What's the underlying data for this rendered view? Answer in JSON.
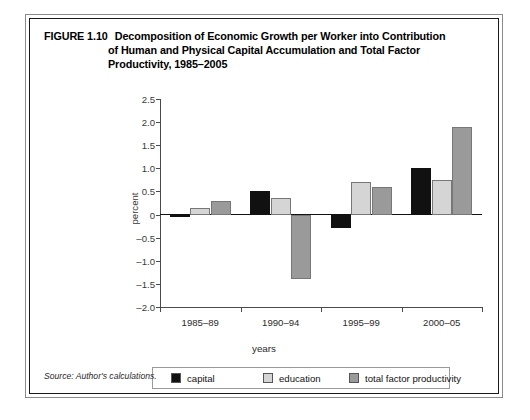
{
  "figure": {
    "number": "FIGURE 1.10",
    "title_lines": [
      "Decomposition of Economic Growth per Worker into Contribution",
      "of Human and Physical Capital Accumulation and Total Factor",
      "Productivity, 1985–2005"
    ],
    "source": "Source: Author's calculations."
  },
  "chart_data": {
    "type": "bar",
    "title": "Decomposition of Economic Growth per Worker into Contribution of Human and Physical Capital Accumulation and Total Factor Productivity, 1985–2005",
    "xlabel": "years",
    "ylabel": "percent",
    "categories": [
      "1985–89",
      "1990–94",
      "1995–99",
      "2000–05"
    ],
    "series": [
      {
        "name": "capital",
        "color": "#111111",
        "values": [
          -0.05,
          0.5,
          -0.3,
          1.0
        ]
      },
      {
        "name": "education",
        "color": "#d5d5d5",
        "values": [
          0.15,
          0.35,
          0.7,
          0.75
        ]
      },
      {
        "name": "total factor productivity",
        "color": "#9a9a9a",
        "values": [
          0.3,
          -1.4,
          0.6,
          1.9
        ]
      }
    ],
    "ylim": [
      -2.0,
      2.5
    ],
    "yticks": [
      2.5,
      2.0,
      1.5,
      1.0,
      0.5,
      0,
      -0.5,
      -1.0,
      -1.5,
      -2.0
    ],
    "ytick_labels": [
      "2.5",
      "2.0",
      "1.5",
      "1.0",
      "0.5",
      "0",
      "–0.5",
      "–1.0",
      "–1.5",
      "–2.0"
    ],
    "grid": false,
    "legend_position": "bottom"
  }
}
